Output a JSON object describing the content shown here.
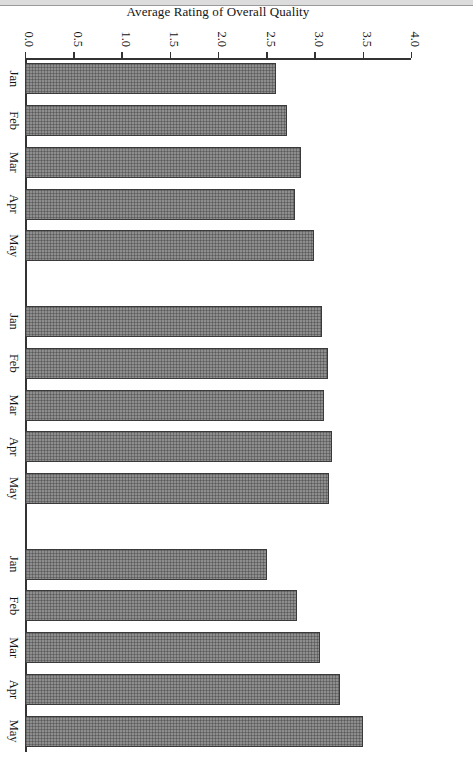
{
  "figure": {
    "orientation": "rotated-90-landscape-on-portrait-page",
    "background_color": "#ffffff",
    "bar_fill_color": "#8e8e8e",
    "bar_edge_color": "#3a3a3a",
    "axis_color": "#333333"
  },
  "chart_data": {
    "type": "bar",
    "title": "",
    "xlabel": "",
    "ylabel": "Average Rating of Overall Quality",
    "ylim": [
      0.0,
      4.0
    ],
    "yticks": [
      "0.0",
      "0.5",
      "1.0",
      "1.5",
      "2.0",
      "2.5",
      "3.0",
      "3.5",
      "4.0"
    ],
    "ytick_values": [
      0.0,
      0.5,
      1.0,
      1.5,
      2.0,
      2.5,
      3.0,
      3.5,
      4.0
    ],
    "grid": false,
    "legend": "none",
    "categories": [
      "Jan",
      "Feb",
      "Mar",
      "Apr",
      "May"
    ],
    "groups": [
      "Supervisory Skills",
      "Piping Design",
      "Writing Proposals"
    ],
    "bars": [
      {
        "group": "Supervisory Skills",
        "category": "Jan",
        "value": 2.6
      },
      {
        "group": "Supervisory Skills",
        "category": "Feb",
        "value": 2.72
      },
      {
        "group": "Supervisory Skills",
        "category": "Mar",
        "value": 2.86
      },
      {
        "group": "Supervisory Skills",
        "category": "Apr",
        "value": 2.8
      },
      {
        "group": "Supervisory Skills",
        "category": "May",
        "value": 3.0
      },
      {
        "group": "Piping Design",
        "category": "Jan",
        "value": 3.08
      },
      {
        "group": "Piping Design",
        "category": "Feb",
        "value": 3.14
      },
      {
        "group": "Piping Design",
        "category": "Mar",
        "value": 3.1
      },
      {
        "group": "Piping Design",
        "category": "Apr",
        "value": 3.18
      },
      {
        "group": "Piping Design",
        "category": "May",
        "value": 3.15
      },
      {
        "group": "Writing Proposals",
        "category": "Jan",
        "value": 2.51
      },
      {
        "group": "Writing Proposals",
        "category": "Feb",
        "value": 2.82
      },
      {
        "group": "Writing Proposals",
        "category": "Mar",
        "value": 3.06
      },
      {
        "group": "Writing Proposals",
        "category": "Apr",
        "value": 3.26
      },
      {
        "group": "Writing Proposals",
        "category": "May",
        "value": 3.5
      }
    ],
    "series": [
      {
        "name": "Supervisory Skills",
        "values": [
          2.6,
          2.72,
          2.86,
          2.8,
          3.0
        ]
      },
      {
        "name": "Piping Design",
        "values": [
          3.08,
          3.14,
          3.1,
          3.18,
          3.15
        ]
      },
      {
        "name": "Writing Proposals",
        "values": [
          2.51,
          2.82,
          3.06,
          3.26,
          3.5
        ]
      }
    ]
  }
}
